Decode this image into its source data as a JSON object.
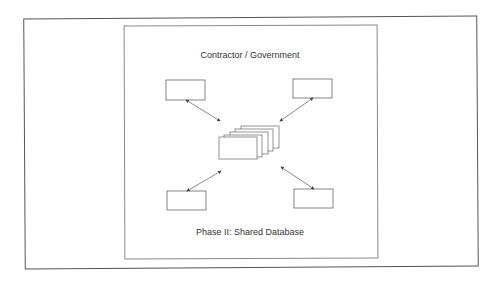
{
  "diagram": {
    "title": "Contractor / Government",
    "caption": "Phase II: Shared Database",
    "nodes": [
      {
        "id": "top-left",
        "label": ""
      },
      {
        "id": "top-right",
        "label": ""
      },
      {
        "id": "bottom-left",
        "label": ""
      },
      {
        "id": "bottom-right",
        "label": ""
      },
      {
        "id": "shared-database",
        "label": "",
        "shape": "stacked-documents",
        "layers": 5
      }
    ],
    "edges": [
      {
        "from": "top-left",
        "to": "shared-database",
        "bidirectional": true
      },
      {
        "from": "top-right",
        "to": "shared-database",
        "bidirectional": true
      },
      {
        "from": "bottom-left",
        "to": "shared-database",
        "bidirectional": true
      },
      {
        "from": "bottom-right",
        "to": "shared-database",
        "bidirectional": true
      }
    ],
    "colors": {
      "stroke": "#555555",
      "text": "#333333",
      "background": "#ffffff"
    }
  }
}
